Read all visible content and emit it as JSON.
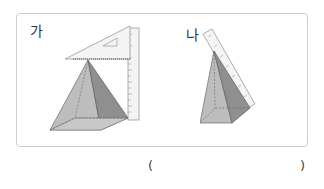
{
  "figures": [
    {
      "label": "가",
      "description": "square pyramid with set square on top and vertical ruler on the right"
    },
    {
      "label": "나",
      "description": "square pyramid with a ruler laid along a slanted edge"
    }
  ],
  "answer": {
    "open": "(",
    "close": ")",
    "value": ""
  },
  "colors": {
    "face_light": "#bdbdbd",
    "face_mid": "#a9a9a9",
    "face_dark": "#8a8a8a",
    "base": "#c8c8c8",
    "ruler": "#f4f4f4",
    "panel_border": "#cfcfcf"
  }
}
